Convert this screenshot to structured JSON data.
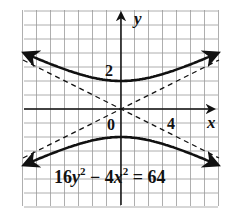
{
  "chart_data": {
    "type": "line",
    "title": "",
    "equation": "16y^2 - 4x^2 = 64",
    "xlabel": "x",
    "ylabel": "y",
    "xlim": [
      -7,
      7
    ],
    "ylim": [
      -7,
      7
    ],
    "grid": true,
    "tick_labels": {
      "x": [
        {
          "value": 4,
          "label": "4"
        }
      ],
      "y": [
        {
          "value": 2,
          "label": "2"
        }
      ],
      "origin": "0"
    },
    "series": [
      {
        "name": "upper branch",
        "style": "solid",
        "formula": "y = 2*sqrt(1 + x^2/16)",
        "x": [
          -7,
          -6,
          -4,
          -2,
          0,
          2,
          4,
          6,
          7
        ],
        "values": [
          4.03,
          3.61,
          2.83,
          2.24,
          2,
          2.24,
          2.83,
          3.61,
          4.03
        ]
      },
      {
        "name": "lower branch",
        "style": "solid",
        "formula": "y = -2*sqrt(1 + x^2/16)",
        "x": [
          -7,
          -6,
          -4,
          -2,
          0,
          2,
          4,
          6,
          7
        ],
        "values": [
          -4.03,
          -3.61,
          -2.83,
          -2.24,
          -2,
          -2.24,
          -2.83,
          -3.61,
          -4.03
        ]
      },
      {
        "name": "asymptote y = x/2",
        "style": "dashed",
        "x": [
          -7,
          7
        ],
        "values": [
          -3.5,
          3.5
        ]
      },
      {
        "name": "asymptote y = -x/2",
        "style": "dashed",
        "x": [
          -7,
          7
        ],
        "values": [
          3.5,
          -3.5
        ]
      }
    ]
  },
  "labels": {
    "x_axis": "x",
    "y_axis": "y",
    "x_tick": "4",
    "y_tick": "2",
    "origin": "0",
    "equation_coef1": "16",
    "equation_var1": "y",
    "equation_exp1": "2",
    "equation_minus": " − ",
    "equation_coef2": "4",
    "equation_var2": "x",
    "equation_exp2": "2",
    "equation_rhs": " = 64"
  }
}
